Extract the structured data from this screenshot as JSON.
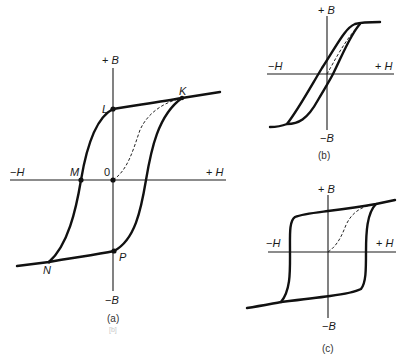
{
  "figure": {
    "type": "hysteresis-loops",
    "panels": [
      {
        "id": "a",
        "caption": "(a)",
        "footer_faint": "[b]",
        "axis_labels": {
          "plus_b": "+",
          "plus_b_var": "B",
          "minus_b": "−",
          "minus_b_var": "B",
          "plus_h": "+",
          "plus_h_var": "H",
          "minus_h": "−",
          "minus_h_var": "H"
        },
        "points": {
          "origin": "0",
          "K": "K",
          "L": "L",
          "M": "M",
          "N": "N",
          "P": "P"
        },
        "description": "Full hysteresis loop with initial magnetization curve (dashed) from 0 to K; remanence L, coercivity M, saturation N, remanence P"
      },
      {
        "id": "b",
        "caption": "(b)",
        "axis_labels": {
          "plus_b": "+",
          "plus_b_var": "B",
          "minus_b": "−",
          "minus_b_var": "B",
          "plus_h": "+",
          "plus_h_var": "H",
          "minus_h": "−",
          "minus_h_var": "H"
        },
        "description": "Narrow hysteresis loop (soft magnetic material)"
      },
      {
        "id": "c",
        "caption": "(c)",
        "axis_labels": {
          "plus_b": "+",
          "plus_b_var": "B",
          "minus_b": "−",
          "minus_b_var": "B",
          "plus_h": "+",
          "plus_h_var": "H",
          "minus_h": "−",
          "minus_h_var": "H"
        },
        "description": "Square hysteresis loop (hard magnetic material)"
      }
    ]
  },
  "colors": {
    "curve": "#111111",
    "axis": "#1a1a1a",
    "background": "#ffffff"
  }
}
